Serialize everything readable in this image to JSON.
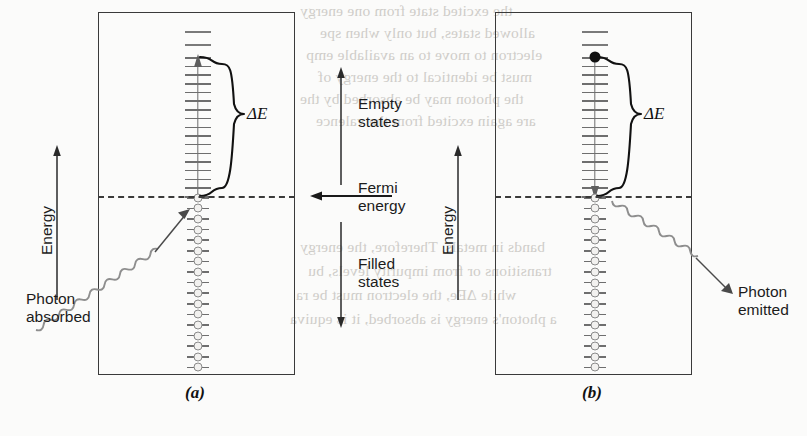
{
  "figure": {
    "type": "physics-band-diagram",
    "background_color": "#fbfbfa",
    "ink_color": "#3a3a3a",
    "state_color": "#8a8a8a"
  },
  "center_labels": {
    "empty_states": "Empty\nstates",
    "fermi_energy": "Fermi\nenergy",
    "filled_states": "Filled\nstates"
  },
  "panels": [
    {
      "id": "a",
      "caption": "(a)",
      "axis_label": "Energy",
      "delta_label": "ΔE",
      "photon_label": "Photon\nabsorbed",
      "transition_direction": "up",
      "excited_marker": "none",
      "empty_rungs": 16,
      "free_rungs": 2,
      "filled_circles": 17
    },
    {
      "id": "b",
      "caption": "(b)",
      "axis_label": "Energy",
      "delta_label": "ΔE",
      "photon_label": "Photon\nemitted",
      "transition_direction": "down",
      "excited_marker": "filled-dot",
      "empty_rungs": 16,
      "free_rungs": 2,
      "filled_circles": 17
    }
  ],
  "bleed_text": [
    "the excited state from one energy",
    "allowed states, but only when spe",
    "electron to move to an available emp",
    "must be identical to the energy of",
    "the photon may be absorbed by the",
    "are again excited from the valence",
    "bands in metals. Therefore, the energy",
    "transitions or from impurity levels, bu",
    "while ΔEe, the electron must be ra",
    "a photon's energy is absorbed, it is equiva"
  ]
}
